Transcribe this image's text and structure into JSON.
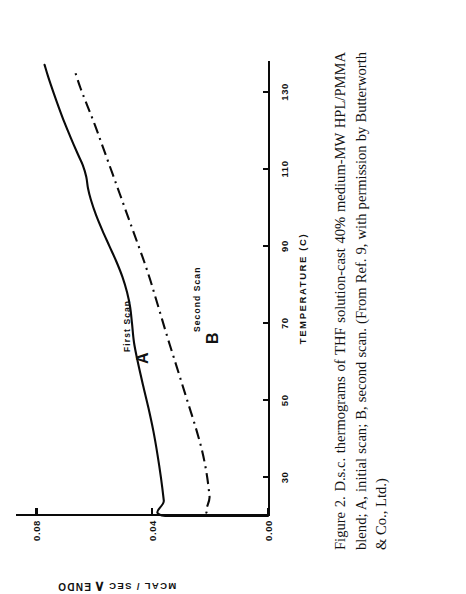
{
  "figure": {
    "caption": "Figure 2. D.s.c. thermograms of THF solution-cast 40% medium-MW HPL/PMMA blend; A, initial scan; B, second scan. (From Ref. 9, with permission by Butterworth & Co., Ltd.)"
  },
  "axes": {
    "x_title": "TEMPERATURE  (C)",
    "y_title": "MCAL / SEC",
    "endo_label": "ENDO",
    "endo_arrow": "∧"
  },
  "annotations": {
    "curve_a_letter": "A",
    "curve_a_sub": "First Scan",
    "curve_b_letter": "B",
    "curve_b_sub": "Second Scan"
  },
  "chart_data": {
    "type": "line",
    "title": "D.s.c. thermograms of THF solution-cast 40% medium-MW HPL/PMMA blend",
    "xlabel": "TEMPERATURE  (C)",
    "ylabel": "MCAL / SEC",
    "xlim": [
      20,
      138
    ],
    "ylim": [
      0.0,
      0.085
    ],
    "xticks": [
      30,
      50,
      70,
      90,
      110,
      130
    ],
    "xticklabels": [
      "30",
      "50",
      "70",
      "90",
      "110",
      "130"
    ],
    "yticks": [
      0.0,
      0.04,
      0.08
    ],
    "yticklabels": [
      "0.00",
      "0.04",
      "0.08"
    ],
    "grid": false,
    "legend": "inline-annotations",
    "series": [
      {
        "name": "A",
        "label": "First Scan",
        "style": "solid",
        "color": "#0a0a0a",
        "x": [
          20,
          20,
          24,
          30,
          36,
          42,
          48,
          54,
          60,
          65,
          70,
          74,
          78,
          82,
          86,
          90,
          94,
          98,
          102,
          105,
          108,
          111,
          114,
          118,
          122,
          126,
          130,
          134,
          137
        ],
        "y": [
          0.0,
          0.0355,
          0.036,
          0.037,
          0.0382,
          0.0396,
          0.0413,
          0.0432,
          0.045,
          0.0463,
          0.047,
          0.0476,
          0.0487,
          0.0503,
          0.0524,
          0.0548,
          0.0572,
          0.0594,
          0.0612,
          0.0622,
          0.0628,
          0.064,
          0.0658,
          0.0681,
          0.0703,
          0.0723,
          0.0742,
          0.076,
          0.0772
        ]
      },
      {
        "name": "B",
        "label": "Second Scan",
        "style": "dash-dot",
        "color": "#0a0a0a",
        "x": [
          20,
          20,
          25,
          31,
          37,
          43,
          49,
          55,
          61,
          66,
          71,
          76,
          81,
          86,
          91,
          96,
          101,
          106,
          111,
          116,
          121,
          126,
          131,
          136
        ],
        "y": [
          0.0,
          0.0198,
          0.0202,
          0.0212,
          0.0228,
          0.025,
          0.0275,
          0.03,
          0.0325,
          0.0346,
          0.0366,
          0.0386,
          0.0406,
          0.0428,
          0.0452,
          0.0476,
          0.05,
          0.0524,
          0.0548,
          0.0572,
          0.0596,
          0.0622,
          0.0648,
          0.067
        ]
      }
    ]
  }
}
